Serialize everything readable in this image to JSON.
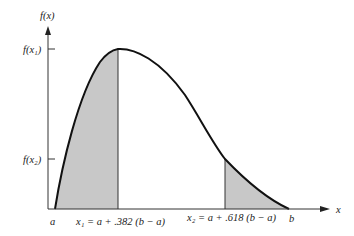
{
  "figure": {
    "type": "golden-section-search-illustration",
    "y_axis_label": "f(x)",
    "x_axis_label": "x",
    "y_ticks": [
      {
        "label": "f(x₁)",
        "name": "f-x1"
      },
      {
        "label": "f(x₂)",
        "name": "f-x2"
      }
    ],
    "x_labels": {
      "a": "a",
      "b": "b",
      "x1": "x₁ = a + .382 (b − a)",
      "x2": "x₂ = a + .618 (b − a)"
    },
    "colors": {
      "curve": "#111111",
      "shade": "#c8c8c8",
      "axis": "#333333"
    }
  }
}
